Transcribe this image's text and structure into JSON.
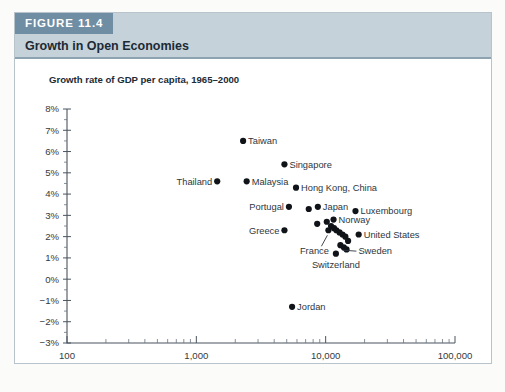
{
  "figure": {
    "tab_label": "FIGURE 11.4",
    "subtitle": "Growth in Open Economies"
  },
  "chart_data": {
    "type": "scatter",
    "title": "Growth in Open Economies",
    "xlabel": "GDP per capita in 1965 (2000 dollars, ratio scale)",
    "ylabel": "Growth rate of GDP per capita, 1965–2000",
    "xscale": "log",
    "xlim": [
      100,
      100000
    ],
    "ylim": [
      -3,
      8
    ],
    "grid": false,
    "legend": "none",
    "x_tick_labels": [
      "100",
      "1,000",
      "10,000",
      "100,000"
    ],
    "x_tick_values": [
      100,
      1000,
      10000,
      100000
    ],
    "y_tick_labels": [
      "8%",
      "7%",
      "6%",
      "5%",
      "4%",
      "3%",
      "2%",
      "1%",
      "0%",
      "−1%",
      "−2%",
      "−3%"
    ],
    "y_tick_values": [
      8,
      7,
      6,
      5,
      4,
      3,
      2,
      1,
      0,
      -1,
      -2,
      -3
    ],
    "points": [
      {
        "label": "Taiwan",
        "x": 2300,
        "y": 6.5,
        "label_pos": "right"
      },
      {
        "label": "Singapore",
        "x": 4800,
        "y": 5.4,
        "label_pos": "right"
      },
      {
        "label": "Thailand",
        "x": 1450,
        "y": 4.6,
        "label_pos": "left"
      },
      {
        "label": "Malaysia",
        "x": 2450,
        "y": 4.6,
        "label_pos": "right"
      },
      {
        "label": "Hong Kong, China",
        "x": 5900,
        "y": 4.3,
        "label_pos": "right"
      },
      {
        "label": "Portugal",
        "x": 5200,
        "y": 3.4,
        "label_pos": "left"
      },
      {
        "label": "Japan",
        "x": 8700,
        "y": 3.4,
        "label_pos": "right"
      },
      {
        "label": "Luxembourg",
        "x": 17000,
        "y": 3.2,
        "label_pos": "right"
      },
      {
        "label": "Norway",
        "x": 11500,
        "y": 2.8,
        "label_pos": "right"
      },
      {
        "label": "Greece",
        "x": 4800,
        "y": 2.3,
        "label_pos": "left"
      },
      {
        "label": "United States",
        "x": 18000,
        "y": 2.1,
        "label_pos": "right"
      },
      {
        "label": "Sweden",
        "x": 13000,
        "y": 1.6,
        "label_pos": "leader-right"
      },
      {
        "label": "France",
        "x": 10500,
        "y": 2.3,
        "label_pos": "leader-below"
      },
      {
        "label": "Switzerland",
        "x": 12000,
        "y": 1.2,
        "label_pos": "below"
      },
      {
        "label": "Jordan",
        "x": 5500,
        "y": -1.3,
        "label_pos": "right"
      }
    ],
    "unlabeled_points": [
      {
        "x": 7400,
        "y": 3.3
      },
      {
        "x": 8600,
        "y": 2.6
      },
      {
        "x": 10200,
        "y": 2.7
      },
      {
        "x": 11000,
        "y": 2.5
      },
      {
        "x": 11600,
        "y": 2.4
      },
      {
        "x": 12100,
        "y": 2.3
      },
      {
        "x": 12800,
        "y": 2.2
      },
      {
        "x": 13500,
        "y": 2.1
      },
      {
        "x": 14200,
        "y": 2.0
      },
      {
        "x": 14900,
        "y": 1.8
      },
      {
        "x": 13800,
        "y": 1.5
      },
      {
        "x": 14500,
        "y": 1.4
      }
    ]
  },
  "colors": {
    "tab_background": "#6f8da3",
    "header_background": "#c6d2da",
    "point_color": "#101418",
    "card_border": "#b9c3cb"
  }
}
